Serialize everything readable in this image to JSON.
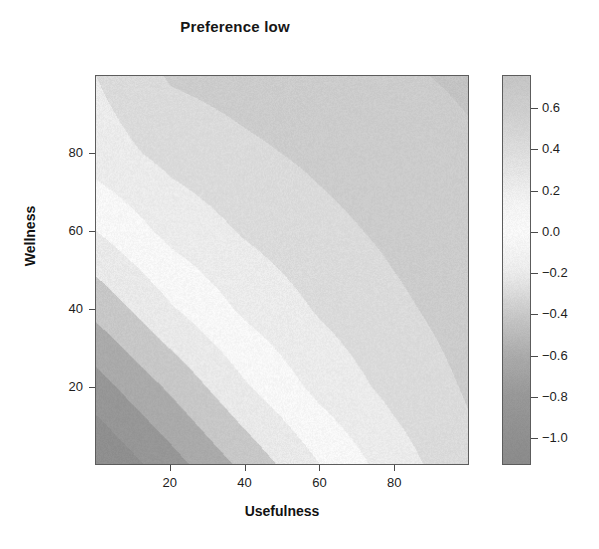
{
  "chart_data": {
    "type": "heatmap",
    "subtype": "filled-contour",
    "title": "Preference low",
    "xlabel": "Usefulness",
    "ylabel": "Wellness",
    "xlim": [
      0,
      100
    ],
    "ylim": [
      0,
      100
    ],
    "xticks": [
      20,
      40,
      60,
      80
    ],
    "yticks": [
      20,
      40,
      60,
      80
    ],
    "xticklabels": [
      "20",
      "40",
      "60",
      "80"
    ],
    "yticklabels": [
      "20",
      "40",
      "60",
      "80"
    ],
    "grid": false,
    "legend": "colorbar-right",
    "zlim": [
      -1.13,
      0.76
    ],
    "colorbar": {
      "ticks": [
        0.6,
        0.4,
        0.2,
        0.0,
        -0.2,
        -0.4,
        -0.6,
        -0.8,
        -1.0
      ],
      "ticklabels": [
        "0.6",
        "0.4",
        "0.2",
        "0.0",
        "-0.2",
        "-0.4",
        "-0.6",
        "-0.8",
        "-1.0"
      ],
      "min": -1.13,
      "max": 0.76,
      "type": "diverging-grayscale",
      "stops": [
        {
          "value": -1.13,
          "color": "#8d8d8d"
        },
        {
          "value": -0.8,
          "color": "#9a9a9a"
        },
        {
          "value": -0.6,
          "color": "#aeaeae"
        },
        {
          "value": -0.4,
          "color": "#cccccc"
        },
        {
          "value": -0.2,
          "color": "#efefef"
        },
        {
          "value": 0.0,
          "color": "#fdfdfd"
        },
        {
          "value": 0.15,
          "color": "#f6f6f6"
        },
        {
          "value": 0.35,
          "color": "#e4e4e4"
        },
        {
          "value": 0.55,
          "color": "#d4d4d4"
        },
        {
          "value": 0.76,
          "color": "#c8c8c8"
        }
      ]
    },
    "surface_model": {
      "description": "Value rises monotonically along the diagonal u = 0.5*x + 0.5*y; iso-contours run anti-diagonally from lower-left (most negative) to upper-right (most positive).",
      "levels": [
        -1.1,
        -0.9,
        -0.7,
        -0.5,
        -0.3,
        -0.1,
        0.1,
        0.3,
        0.5,
        0.7
      ],
      "corner_values": {
        "bottom_left": -1.1,
        "bottom_right": 0.45,
        "top_left": 0.3,
        "top_right": 0.72,
        "center": 0.22
      },
      "sample_grid": {
        "x": [
          0,
          20,
          40,
          60,
          80,
          100
        ],
        "y": [
          0,
          20,
          40,
          60,
          80,
          100
        ],
        "z": [
          [
            -1.1,
            -0.78,
            -0.44,
            -0.1,
            0.2,
            0.45
          ],
          [
            -0.78,
            -0.46,
            -0.12,
            0.16,
            0.36,
            0.52
          ],
          [
            -0.44,
            -0.12,
            0.14,
            0.32,
            0.46,
            0.58
          ],
          [
            -0.1,
            0.16,
            0.32,
            0.44,
            0.54,
            0.63
          ],
          [
            0.2,
            0.36,
            0.46,
            0.54,
            0.62,
            0.68
          ],
          [
            0.3,
            0.52,
            0.58,
            0.63,
            0.68,
            0.72
          ]
        ]
      }
    }
  },
  "accessibility": {
    "plot_region_name": "filled contour surface",
    "colorbar_name": "value colour key"
  }
}
